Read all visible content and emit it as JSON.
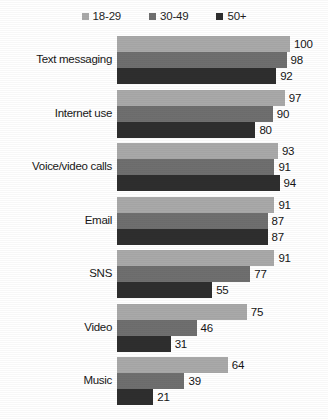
{
  "chart_data": {
    "type": "bar",
    "orientation": "horizontal",
    "title": "",
    "subtitle": "",
    "xlabel": "",
    "ylabel": "",
    "xlim": [
      0,
      100
    ],
    "grid": false,
    "legend_position": "top",
    "categories": [
      "Text messaging",
      "Internet use",
      "Voice/video calls",
      "Email",
      "SNS",
      "Video",
      "Music"
    ],
    "series": [
      {
        "name": "18-29",
        "color": "#a9a9a9",
        "values": [
          100,
          97,
          93,
          91,
          91,
          75,
          64
        ]
      },
      {
        "name": "30-49",
        "color": "#6f6f6f",
        "values": [
          98,
          90,
          91,
          87,
          77,
          46,
          39
        ]
      },
      {
        "name": "50+",
        "color": "#2e2e2e",
        "values": [
          92,
          80,
          94,
          87,
          55,
          31,
          21
        ]
      }
    ],
    "value_labels": [
      [
        "100",
        "98",
        "92"
      ],
      [
        "97",
        "90",
        "80"
      ],
      [
        "93",
        "91",
        "94"
      ],
      [
        "91",
        "87",
        "87"
      ],
      [
        "91",
        "77",
        "55"
      ],
      [
        "75",
        "46",
        "31"
      ],
      [
        "64",
        "39",
        "21"
      ]
    ]
  },
  "legend": {
    "items": [
      {
        "label": "18-29",
        "color": "#a9a9a9"
      },
      {
        "label": "30-49",
        "color": "#6f6f6f"
      },
      {
        "label": "50+",
        "color": "#2e2e2e"
      }
    ]
  },
  "colors": {
    "background": "#ffffff",
    "text": "#1a1a1a",
    "series_18_29": "#a9a9a9",
    "series_30_49": "#6f6f6f",
    "series_50_plus": "#2e2e2e"
  }
}
